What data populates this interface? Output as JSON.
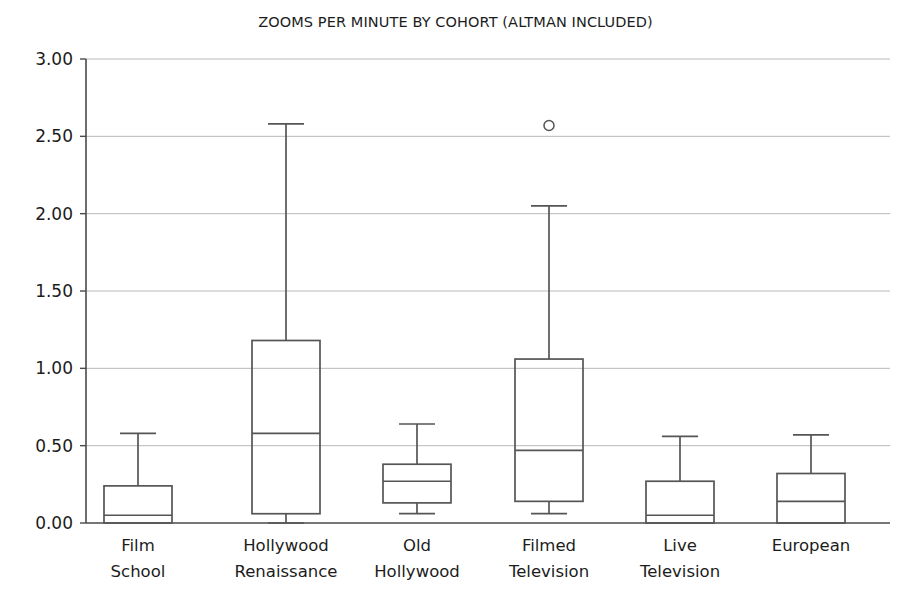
{
  "chart_data": {
    "type": "box",
    "title": "ZOOMS PER MINUTE BY COHORT (ALTMAN INCLUDED)",
    "xlabel": "",
    "ylabel": "",
    "ylim": [
      0.0,
      3.0
    ],
    "grid": true,
    "legend": "none",
    "yticks": [
      "0.00",
      "0.50",
      "1.00",
      "1.50",
      "2.00",
      "2.50",
      "3.00"
    ],
    "ytick_values": [
      0.0,
      0.5,
      1.0,
      1.5,
      2.0,
      2.5,
      3.0
    ],
    "categories": [
      "Film School",
      "Hollywood Renaissance",
      "Old Hollywood",
      "Filmed Television",
      "Live Television",
      "European"
    ],
    "category_lines": [
      [
        "Film",
        "School"
      ],
      [
        "Hollywood",
        "Renaissance"
      ],
      [
        "Old",
        "Hollywood"
      ],
      [
        "Filmed",
        "Television"
      ],
      [
        "Live",
        "Television"
      ],
      [
        "European"
      ]
    ],
    "boxes": [
      {
        "category": "Film School",
        "whisker_low": 0.0,
        "q1": 0.0,
        "median": 0.05,
        "q3": 0.24,
        "whisker_high": 0.58,
        "outliers": []
      },
      {
        "category": "Hollywood Renaissance",
        "whisker_low": 0.0,
        "q1": 0.06,
        "median": 0.58,
        "q3": 1.18,
        "whisker_high": 2.58,
        "outliers": []
      },
      {
        "category": "Old Hollywood",
        "whisker_low": 0.06,
        "q1": 0.13,
        "median": 0.27,
        "q3": 0.38,
        "whisker_high": 0.64,
        "outliers": []
      },
      {
        "category": "Filmed Television",
        "whisker_low": 0.06,
        "q1": 0.14,
        "median": 0.47,
        "q3": 1.06,
        "whisker_high": 2.05,
        "outliers": [
          2.57
        ]
      },
      {
        "category": "Live Television",
        "whisker_low": 0.0,
        "q1": 0.0,
        "median": 0.05,
        "q3": 0.27,
        "whisker_high": 0.56,
        "outliers": []
      },
      {
        "category": "European",
        "whisker_low": 0.0,
        "q1": 0.0,
        "median": 0.14,
        "q3": 0.32,
        "whisker_high": 0.57,
        "outliers": []
      }
    ],
    "colors": {
      "stroke": "#555555",
      "grid": "#b9b9b9",
      "axis": "#4a4a4a",
      "text": "#1c1c1c",
      "background": "#ffffff"
    }
  },
  "geometry": {
    "plot_left": 86,
    "plot_right": 890,
    "plot_top": 59,
    "plot_bottom": 523,
    "box_half_width": 34,
    "cap_half_width": 18,
    "outlier_radius": 5,
    "category_centers": [
      138,
      286,
      417,
      549,
      680,
      811
    ]
  }
}
